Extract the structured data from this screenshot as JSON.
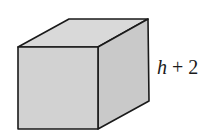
{
  "diagram": {
    "type": "cube",
    "edge_label": {
      "variable": "h",
      "operator": " + ",
      "constant": "2"
    },
    "colors": {
      "background": "#ffffff",
      "front_face": "#d2d2d2",
      "top_face": "#d9d9d9",
      "side_face": "#c9c9c9",
      "edge": "#1a1a1a"
    }
  }
}
